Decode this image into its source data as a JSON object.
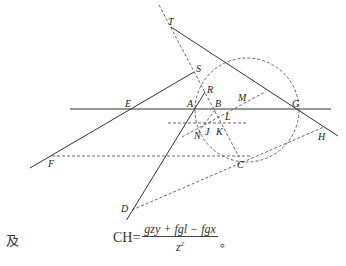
{
  "points": {
    "T": "T",
    "S": "S",
    "R": "R",
    "E": "E",
    "A": "A",
    "B": "B",
    "M": "M",
    "G": "G",
    "L": "L",
    "N": "N",
    "J": "J",
    "K": "K",
    "H": "H",
    "F": "F",
    "C": "C",
    "D": "D"
  },
  "caption": {
    "prefix": "及",
    "lhs": "CH",
    "equals": "=",
    "numerator": "gzy + fgl − fgx",
    "denominator": "z",
    "denominator_exponent": "2",
    "end": "。"
  }
}
